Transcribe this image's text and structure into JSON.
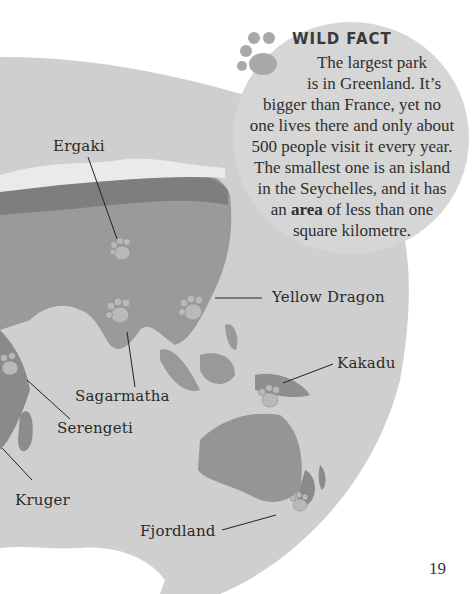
{
  "wild_fact": {
    "title": "WILD FACT",
    "line1": "The largest park",
    "line2": "is in Greenland. It’s",
    "line3": "bigger than France, yet no",
    "line4": "one lives there and only about",
    "line5": "500 people visit it every year.",
    "line6": "The smallest one is an island",
    "line7": "in the Seychelles, and it has",
    "line8_pre": "an ",
    "line8_bold": "area",
    "line8_post": " of less than one",
    "line9": "square kilometre."
  },
  "map": {
    "labels": {
      "ergaki": "Ergaki",
      "yellow_dragon": "Yellow Dragon",
      "kakadu": "Kakadu",
      "sagarmatha": "Sagarmatha",
      "serengeti": "Serengeti",
      "kruger": "Kruger",
      "fjordland": "Fjordland"
    },
    "colors": {
      "ocean": "#cfcfcf",
      "land": "#9a9a9a",
      "land_dark": "#808080",
      "coast": "#e8e8e8"
    }
  },
  "page_number": "19"
}
